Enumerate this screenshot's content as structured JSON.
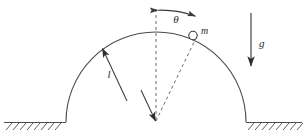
{
  "figure": {
    "kind": "physics-free-body-diagram",
    "background_color": "#ffffff",
    "stroke_color": "#444444",
    "label_color": "#2b2b2b"
  },
  "labels": {
    "angle": "θ",
    "mass": "m",
    "gravity": "g",
    "radius": "l"
  },
  "geometry": {
    "dome": {
      "center_x": 156,
      "center_y": 122,
      "radius": 90,
      "left_foot_x": 66,
      "right_foot_x": 246,
      "apex_y": 32
    },
    "ground": {
      "y": 122,
      "left_segment": [
        4,
        66
      ],
      "right_segment": [
        246,
        302
      ],
      "hatch_count_left": 8,
      "hatch_count_right": 8
    },
    "vertical_dashed_line": {
      "x": 156,
      "y_top": 9,
      "y_bottom": 122
    },
    "radius_to_mass_dashed": {
      "from": [
        156,
        122
      ],
      "to": [
        196,
        38
      ]
    },
    "mass_marker": {
      "cx": 193,
      "cy": 35,
      "r": 4.2
    },
    "radius_arrow_l": {
      "from": [
        126,
        100
      ],
      "to": [
        101,
        47
      ],
      "label_pos": [
        112,
        74
      ]
    },
    "theta_arc": {
      "start": [
        156,
        10
      ],
      "end": [
        197,
        17
      ],
      "label_pos": [
        176,
        21
      ],
      "double_headed": true
    },
    "gravity_arrow": {
      "x": 251,
      "y_top": 13,
      "y_bottom": 69,
      "label_pos": [
        258,
        44
      ]
    }
  }
}
